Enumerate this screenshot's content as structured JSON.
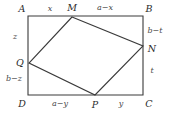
{
  "figure": {
    "type": "geometry-diagram",
    "width": 170,
    "height": 114,
    "stroke_color": "#3a3a3a",
    "label_color": "#2b2b2b",
    "background": "#ffffff"
  },
  "rectangle": {
    "name": "ABCD",
    "corners": [
      {
        "key": "A",
        "label": "A",
        "x": 22,
        "y": 9
      },
      {
        "key": "B",
        "label": "B",
        "x": 149,
        "y": 9
      },
      {
        "key": "C",
        "label": "C",
        "x": 149,
        "y": 104
      },
      {
        "key": "D",
        "label": "D",
        "x": 22,
        "y": 104
      }
    ]
  },
  "inner_quad": {
    "name": "MNPQ",
    "vertices": [
      {
        "key": "M",
        "label": "M",
        "lx": 72,
        "ly": 8
      },
      {
        "key": "N",
        "label": "N",
        "lx": 152,
        "ly": 49
      },
      {
        "key": "P",
        "label": "P",
        "lx": 95,
        "ly": 105
      },
      {
        "key": "Q",
        "label": "Q",
        "lx": 20,
        "ly": 63
      }
    ]
  },
  "segment_labels": [
    {
      "key": "AM",
      "text": "x",
      "x": 50,
      "y": 9,
      "side": "top"
    },
    {
      "key": "MB",
      "text": "a−x",
      "x": 105,
      "y": 8,
      "side": "top"
    },
    {
      "key": "BN",
      "text": "b−t",
      "x": 155,
      "y": 31,
      "side": "right"
    },
    {
      "key": "NC",
      "text": "t",
      "x": 152,
      "y": 71,
      "side": "right"
    },
    {
      "key": "DP",
      "text": "a−y",
      "x": 60,
      "y": 104,
      "side": "bottom"
    },
    {
      "key": "PC",
      "text": "y",
      "x": 121,
      "y": 104,
      "side": "bottom"
    },
    {
      "key": "AQ",
      "text": "z",
      "x": 15,
      "y": 37,
      "side": "left"
    },
    {
      "key": "QD",
      "text": "b−z",
      "x": 14,
      "y": 79,
      "side": "left"
    }
  ]
}
